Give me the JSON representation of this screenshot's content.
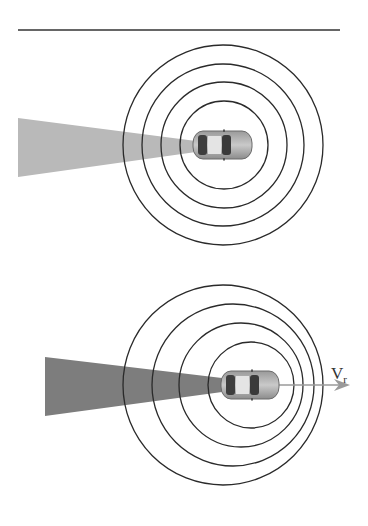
{
  "figure": {
    "top_rule": {
      "x1": 18,
      "x2": 340,
      "y": 30,
      "color": "#333333"
    },
    "panels": [
      {
        "id": "stationary",
        "beam": {
          "color": "#b9b9b9",
          "left_x": 18,
          "top_y": 118,
          "bottom_y": 177,
          "tip_x": 196,
          "tip_top_y": 141,
          "tip_bottom_y": 152
        },
        "car": {
          "x": 193,
          "y": 131,
          "w": 59,
          "h": 28
        },
        "wavefronts": [
          {
            "cx": 223,
            "cy": 145,
            "r": 100
          },
          {
            "cx": 223,
            "cy": 145,
            "r": 81
          },
          {
            "cx": 224,
            "cy": 145,
            "r": 63
          },
          {
            "cx": 224,
            "cy": 145,
            "r": 44
          }
        ],
        "wave_color": "#2a2a2a"
      },
      {
        "id": "moving",
        "beam": {
          "color": "#7d7d7d",
          "left_x": 45,
          "top_y": 357,
          "bottom_y": 416,
          "tip_x": 222,
          "tip_top_y": 378,
          "tip_bottom_y": 392
        },
        "car": {
          "x": 221,
          "y": 371,
          "w": 58,
          "h": 28
        },
        "wavefronts": [
          {
            "cx": 223,
            "cy": 385,
            "r": 100
          },
          {
            "cx": 233,
            "cy": 385,
            "r": 81
          },
          {
            "cx": 241,
            "cy": 385,
            "r": 62
          },
          {
            "cx": 251,
            "cy": 385,
            "r": 43
          }
        ],
        "wave_color": "#2a2a2a",
        "velocity_arrow": {
          "x1": 279,
          "x2": 350,
          "y": 385,
          "color": "#9a9a9a"
        },
        "velocity_label": {
          "main": "V",
          "sub": "r",
          "x": 331,
          "y": 364
        }
      }
    ]
  }
}
